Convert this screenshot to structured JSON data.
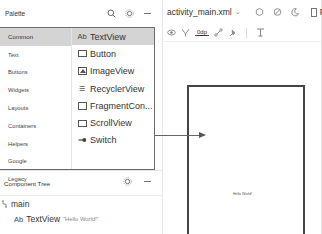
{
  "palette": {
    "title": "Palette",
    "icons": [
      "search-icon",
      "gear-icon",
      "minimize-icon"
    ],
    "categories": [
      "Common",
      "Text",
      "Buttons",
      "Widgets",
      "Layouts",
      "Containers",
      "Helpers",
      "Google",
      "Legacy"
    ],
    "selected_category": "Common",
    "widgets": [
      {
        "label": "TextView",
        "icon": "ab-icon",
        "glyph": "Ab",
        "selected": true
      },
      {
        "label": "Button",
        "icon": "button-icon",
        "selected": false
      },
      {
        "label": "ImageView",
        "icon": "image-icon",
        "selected": false
      },
      {
        "label": "RecyclerView",
        "icon": "list-icon",
        "glyph": "☰",
        "selected": false
      },
      {
        "label": "FragmentCon...",
        "icon": "fragment-icon",
        "selected": false
      },
      {
        "label": "ScrollView",
        "icon": "scroll-icon",
        "selected": false
      },
      {
        "label": "Switch",
        "icon": "switch-icon",
        "glyph": "⊸",
        "selected": false
      }
    ]
  },
  "component_tree": {
    "title": "Component Tree",
    "root": {
      "label": "main",
      "icon_glyph": "⊓"
    },
    "child": {
      "glyph": "Ab",
      "label": "TextView",
      "hint": "\"Hello World!\""
    }
  },
  "editor": {
    "file_tab": "activity_main.xml",
    "tab_arrow": "⌄",
    "tab_icons": [
      "design-surface-icon",
      "orientation-icon",
      "night-mode-icon"
    ],
    "device_label": "Pi",
    "toolbar": {
      "margin_value": "0dp"
    },
    "canvas_text": "Hello World!"
  }
}
